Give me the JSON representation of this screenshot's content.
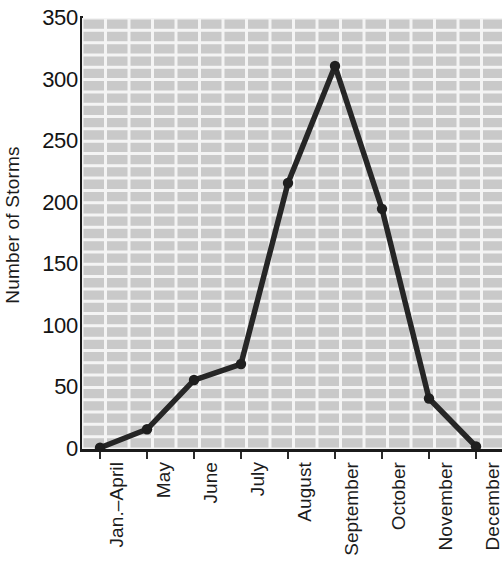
{
  "chart_data": {
    "type": "line",
    "title": "",
    "xlabel": "",
    "ylabel": "Number of Storms",
    "categories": [
      "Jan.–April",
      "May",
      "June",
      "July",
      "August",
      "September",
      "October",
      "November",
      "December"
    ],
    "values": [
      1,
      16,
      56,
      69,
      216,
      311,
      195,
      41,
      2
    ],
    "series": [
      {
        "name": "Number of Storms",
        "values": [
          1,
          16,
          56,
          69,
          216,
          311,
          195,
          41,
          2
        ]
      }
    ],
    "ylim": [
      0,
      350
    ],
    "ytick_labels": [
      "0",
      "50",
      "100",
      "150",
      "200",
      "250",
      "300",
      "350"
    ],
    "ytick_values": [
      0,
      50,
      100,
      150,
      200,
      250,
      300,
      350
    ],
    "grid": true,
    "grid_minor_step": 10,
    "legend": "none",
    "marker": "circle",
    "colors": {
      "line": "#262626",
      "marker": "#1f1f1f",
      "plot_background": "#c9c9c9",
      "gridline": "#f2f2f2",
      "axis": "#1b1b1b",
      "text": "#1c1c1c"
    }
  }
}
